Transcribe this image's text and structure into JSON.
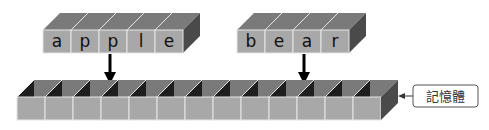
{
  "diagram": {
    "title": "",
    "words": [
      {
        "id": "apple",
        "letters": [
          "a",
          "p",
          "p",
          "l",
          "e"
        ],
        "x": 43,
        "pointer_cell_index": 2
      },
      {
        "id": "bear",
        "letters": [
          "b",
          "e",
          "a",
          "r"
        ],
        "x": 237,
        "pointer_cell_index": 2
      }
    ],
    "memory": {
      "label": "記憶體",
      "cell_count": 13,
      "x": 17
    },
    "colors": {
      "front_face": "#a8a8a8",
      "top_face": "#7a7a7a",
      "side_face": "#4a4a4a",
      "cell_inner_dark": "#1e1e1e",
      "divider": "#e6e6e6",
      "arrow": "#000000",
      "label_border": "#555555"
    }
  }
}
